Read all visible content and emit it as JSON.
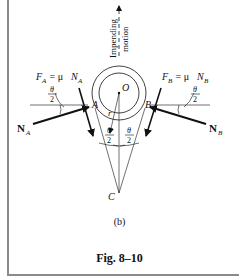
{
  "figure": {
    "subfigure_label": "(b)",
    "caption": "Fig. 8–10"
  },
  "labels": {
    "motion_line1": "Impending",
    "motion_line2": "motion",
    "center": "O",
    "radius": "r",
    "point_a": "A",
    "point_b": "B",
    "point_c": "C",
    "friction_a": {
      "F": "F",
      "sub": "A",
      "eq": " = μ ",
      "N": "N",
      "nsub": "A"
    },
    "friction_b": {
      "F": "F",
      "sub": "B",
      "eq": " = μ ",
      "N": "N",
      "nsub": "B"
    },
    "normal_a": {
      "N": "N",
      "sub": "A"
    },
    "normal_b": {
      "N": "N",
      "sub": "B"
    },
    "theta": "θ",
    "two": "2"
  },
  "colors": {
    "ink": "#111111",
    "frame": "#8a8a8a"
  }
}
